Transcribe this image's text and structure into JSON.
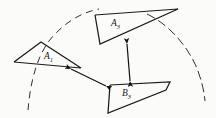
{
  "figure": {
    "background_color": "#fbfbfa",
    "ink_color": "#1a1a1a",
    "width": 216,
    "height": 118
  },
  "shapes": [
    {
      "id": "a1",
      "label_base": "A",
      "label_sub": "1",
      "kind": "triangle",
      "label_x": 44,
      "label_y": 59,
      "points": "14,62 41,42 81,68 14,62"
    },
    {
      "id": "a3",
      "label_base": "A",
      "label_sub": "3",
      "kind": "triangle",
      "label_x": 111,
      "label_y": 26,
      "points": "95,15 178,9 100,44 95,15"
    },
    {
      "id": "b3",
      "label_base": "B",
      "label_sub": "3",
      "kind": "quadrilateral",
      "label_x": 122,
      "label_y": 96,
      "points": "110,85 170,82 166,90 108,113 110,85"
    }
  ],
  "arrows": [
    {
      "id": "a1-to-b3",
      "kind": "double-headed",
      "x1": 71,
      "y1": 69,
      "x2": 106,
      "y2": 86
    },
    {
      "id": "a3-to-b3",
      "kind": "double-headed",
      "x1": 127,
      "y1": 44,
      "x2": 130,
      "y2": 81
    }
  ],
  "arcs": [
    {
      "id": "left-arc",
      "style": "dashed",
      "path": "M 28,110 C 30,86 36,52 56,33 C 70,19 84,12 99,9"
    },
    {
      "id": "right-arc",
      "style": "dashed",
      "path": "M 147,14 C 168,24 186,44 196,66 C 201,78 204,90 205,101"
    }
  ],
  "icons": {
    "arrowhead": "triangle-arrowhead"
  }
}
